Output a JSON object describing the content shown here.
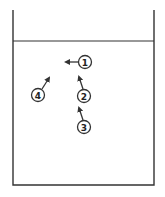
{
  "diagram": {
    "title": "",
    "container": {
      "type": "beaker",
      "left_x": 13,
      "right_x": 154,
      "top_y": 10,
      "bottom_y": 185,
      "liquid_level_y": 41,
      "stroke_color": "#444444"
    },
    "markers": [
      {
        "label": "1",
        "cx": 85,
        "cy": 62,
        "r": 6.5,
        "arrow": {
          "x1": 78,
          "y1": 62,
          "x2": 66,
          "y2": 62
        }
      },
      {
        "label": "2",
        "cx": 84,
        "cy": 96,
        "r": 6.5,
        "arrow": {
          "x1": 83,
          "y1": 89,
          "x2": 79,
          "y2": 77
        }
      },
      {
        "label": "3",
        "cx": 84,
        "cy": 127,
        "r": 6.5,
        "arrow": {
          "x1": 83,
          "y1": 120,
          "x2": 79,
          "y2": 108
        }
      },
      {
        "label": "4",
        "cx": 38,
        "cy": 95,
        "r": 6.5,
        "arrow": {
          "x1": 42,
          "y1": 89,
          "x2": 49,
          "y2": 78
        }
      }
    ],
    "colors": {
      "line": "#333333",
      "background": "#ffffff"
    }
  }
}
